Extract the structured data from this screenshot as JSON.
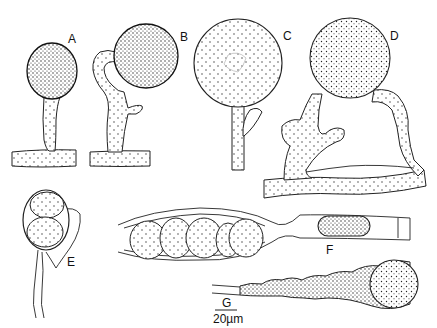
{
  "figure": {
    "panels": [
      {
        "id": "A",
        "label": "A"
      },
      {
        "id": "B",
        "label": "B"
      },
      {
        "id": "C",
        "label": "C"
      },
      {
        "id": "D",
        "label": "D"
      },
      {
        "id": "E",
        "label": "E"
      },
      {
        "id": "F",
        "label": "F"
      },
      {
        "id": "G",
        "label": "G"
      }
    ],
    "scale_bar": {
      "label": "20µm",
      "value": 20,
      "unit": "µm"
    }
  }
}
